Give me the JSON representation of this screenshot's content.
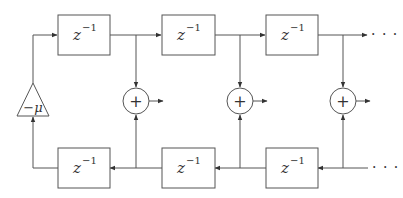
{
  "diagram": {
    "type": "block-diagram",
    "delay_label_base": "z",
    "delay_label_exp": "−1",
    "gain_label": "−μ",
    "adder_symbol": "+",
    "continuation": "· · ·",
    "top_row": [
      {
        "id": "top-delay-1",
        "label": "z⁻¹"
      },
      {
        "id": "top-delay-2",
        "label": "z⁻¹"
      },
      {
        "id": "top-delay-3",
        "label": "z⁻¹"
      }
    ],
    "bottom_row": [
      {
        "id": "bottom-delay-1",
        "label": "z⁻¹"
      },
      {
        "id": "bottom-delay-2",
        "label": "z⁻¹"
      },
      {
        "id": "bottom-delay-3",
        "label": "z⁻¹"
      }
    ],
    "adders": [
      {
        "id": "adder-1",
        "symbol": "+"
      },
      {
        "id": "adder-2",
        "symbol": "+"
      },
      {
        "id": "adder-3",
        "symbol": "+"
      }
    ],
    "gain": {
      "id": "gain-block",
      "label": "−μ"
    },
    "colors": {
      "stroke": "#555555",
      "text": "#333333",
      "background": "#ffffff"
    }
  }
}
